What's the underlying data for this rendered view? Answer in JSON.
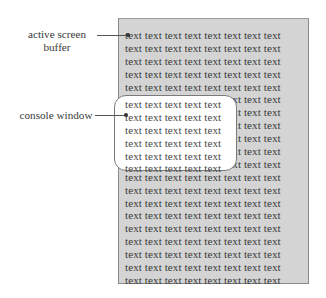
{
  "labels": {
    "active_screen_buffer_line1": "active screen",
    "active_screen_buffer_line2": "buffer",
    "console_window": "console window"
  },
  "buffer": {
    "rows": [
      "text text text text text text text text",
      "text text text text text text text text",
      "text text text text text text text text",
      "text text text text text text text text",
      "text text text text text text text text",
      "text text text text text text text text",
      "text text text text text text text text",
      "text text text text text text text text",
      "text text text text text text text text",
      "text text text text text text text text",
      "text text text text text text text text",
      "text text text text text text text text",
      "text text text text text text text text",
      "text text text text text text text text",
      "text text text text text text text text",
      "text text text text text text text text",
      "text text text text text text text text",
      "text text text text text text text text",
      "text text text text text text text text",
      "text text text text text text text text"
    ]
  },
  "console": {
    "rows": [
      "text text text text text",
      "text text text text text",
      "text text text text text",
      "text text text text text",
      "text text text text text",
      "text text text text text"
    ]
  },
  "colors": {
    "buffer_bg": "#d4d4d4",
    "console_bg": "#ffffff",
    "text": "#3a3a3a"
  }
}
